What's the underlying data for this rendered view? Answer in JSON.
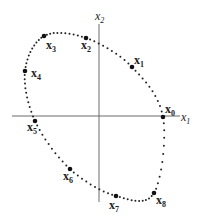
{
  "diagram": {
    "type": "phase-portrait-orbit",
    "axes": {
      "horizontal": {
        "label": "x",
        "subscript": "1"
      },
      "vertical": {
        "label": "x",
        "subscript": "2"
      }
    },
    "points": [
      {
        "name": "x",
        "sub": "0",
        "pos": [
          163,
          117
        ],
        "lbl": [
          165,
          113
        ]
      },
      {
        "name": "x",
        "sub": "1",
        "pos": [
          132,
          67
        ],
        "lbl": [
          134,
          64
        ]
      },
      {
        "name": "x",
        "sub": "2",
        "pos": [
          86,
          38
        ],
        "lbl": [
          81,
          49
        ]
      },
      {
        "name": "x",
        "sub": "3",
        "pos": [
          44,
          36
        ],
        "lbl": [
          46,
          49
        ]
      },
      {
        "name": "x",
        "sub": "4",
        "pos": [
          25,
          71
        ],
        "lbl": [
          31,
          77
        ]
      },
      {
        "name": "x",
        "sub": "5",
        "pos": [
          35,
          121
        ],
        "lbl": [
          27,
          131
        ]
      },
      {
        "name": "x",
        "sub": "6",
        "pos": [
          70,
          169
        ],
        "lbl": [
          63,
          180
        ]
      },
      {
        "name": "x",
        "sub": "7",
        "pos": [
          116,
          196
        ],
        "lbl": [
          109,
          209
        ]
      },
      {
        "name": "x",
        "sub": "8",
        "pos": [
          154,
          193
        ],
        "lbl": [
          156,
          204
        ]
      }
    ],
    "colors": {
      "axis": "#6a6a6a",
      "points": "#222222",
      "background": "#ffffff"
    }
  }
}
